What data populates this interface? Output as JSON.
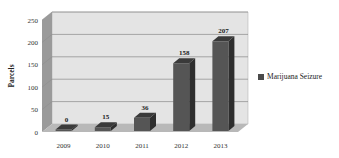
{
  "chart_data": {
    "type": "bar",
    "style": "3d-column",
    "title": "",
    "xlabel": "",
    "ylabel": "Parcels",
    "categories": [
      "2009",
      "2010",
      "2011",
      "2012",
      "2013"
    ],
    "series": [
      {
        "name": "Marijuana Seizure",
        "values": [
          0,
          15,
          36,
          158,
          207
        ]
      }
    ],
    "data_labels": [
      "0",
      "15",
      "36",
      "158",
      "207"
    ],
    "yticks": [
      "0",
      "50",
      "100",
      "150",
      "200",
      "250"
    ],
    "ylim": [
      0,
      250
    ],
    "grid": true,
    "legend_position": "right"
  },
  "colors": {
    "bar_front": "#555555",
    "bar_side": "#2e2e2e",
    "bar_top": "#3a3a3a",
    "wall": "#e4e4e4",
    "side_wall": "#9a9a9a",
    "floor": "#b8b8b8",
    "gridline": "#8a8a8a"
  },
  "legend": {
    "label": "Marijuana Seizure"
  }
}
